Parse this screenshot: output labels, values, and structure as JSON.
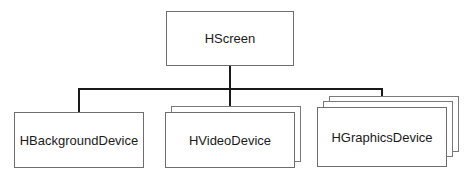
{
  "diagram": {
    "type": "hierarchy",
    "root": {
      "label": "HScreen"
    },
    "children": [
      {
        "label": "HBackgroundDevice",
        "stack_depth": 1
      },
      {
        "label": "HVideoDevice",
        "stack_depth": 2
      },
      {
        "label": "HGraphicsDevice",
        "stack_depth": 3
      }
    ],
    "colors": {
      "connector": "#1a1a1a",
      "box_border": "#6e6e6e",
      "text": "#1a1a1a",
      "background": "#ffffff"
    }
  }
}
